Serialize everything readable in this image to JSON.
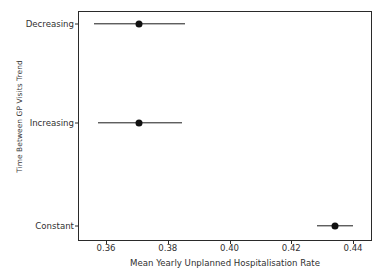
{
  "chart_data": {
    "type": "scatter",
    "title": "",
    "xlabel": "Mean Yearly Unplanned Hospitalisation Rate",
    "ylabel": "Time Between GP Visits Trend",
    "orientation": "horizontal",
    "grid": false,
    "legend": "none",
    "xlim": [
      0.3486,
      0.4486
    ],
    "xticks": [
      "0.36",
      "0.38",
      "0.40",
      "0.42",
      "0.44"
    ],
    "xtick_values": [
      0.36,
      0.38,
      0.4,
      0.42,
      0.44
    ],
    "categories": [
      "Decreasing",
      "Increasing",
      "Constant"
    ],
    "series": [
      {
        "name": "Mean Yearly Unplanned Hospitalisation Rate",
        "marker": "point-with-error-bar",
        "color": "#111111",
        "points": [
          {
            "category": "Decreasing",
            "value": 0.3692,
            "low": 0.3542,
            "high": 0.3849
          },
          {
            "category": "Increasing",
            "value": 0.3694,
            "low": 0.3555,
            "high": 0.384
          },
          {
            "category": "Constant",
            "value": 0.436,
            "low": 0.4299,
            "high": 0.4422
          }
        ]
      }
    ]
  },
  "axes": {
    "x_tick_labels": [
      "0.36",
      "0.38",
      "0.40",
      "0.42",
      "0.44"
    ],
    "y_tick_labels": [
      "Decreasing",
      "Increasing",
      "Constant"
    ],
    "x_title": "Mean Yearly Unplanned Hospitalisation Rate",
    "y_title": "Time Between GP Visits Trend"
  },
  "style": {
    "marker_color": "#111111",
    "axis_color": "#2a2a2a",
    "text_color": "#303030",
    "background": "#ffffff"
  }
}
